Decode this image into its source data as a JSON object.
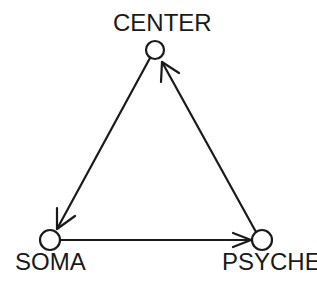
{
  "diagram": {
    "type": "triangle-flow",
    "stroke_color": "#1a1a1a",
    "background": "#ffffff",
    "nodes": [
      {
        "id": "center",
        "label": "CENTER",
        "cx": 155,
        "cy": 50,
        "r": 9
      },
      {
        "id": "soma",
        "label": "SOMA",
        "cx": 50,
        "cy": 240,
        "r": 10
      },
      {
        "id": "psyche",
        "label": "PSYCHE",
        "cx": 262,
        "cy": 240,
        "r": 10
      }
    ],
    "edges": [
      {
        "from": "center",
        "to": "soma",
        "directed": true
      },
      {
        "from": "soma",
        "to": "psyche",
        "directed": true
      },
      {
        "from": "psyche",
        "to": "center",
        "directed": true
      }
    ]
  }
}
